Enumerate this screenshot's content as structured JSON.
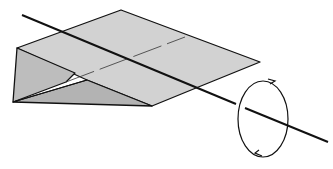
{
  "diagram": {
    "axis": "longitudinal rotation axis",
    "rotation_indicator": "circular arrow around axis",
    "colors": {
      "background": "#ffffff",
      "wing_fill": "#cfcfcf",
      "side_fill": "#b5b5b5",
      "stroke": "#111111"
    }
  }
}
